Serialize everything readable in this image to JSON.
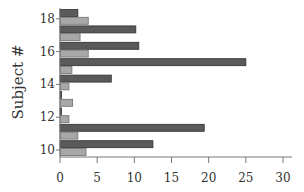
{
  "chart_data": {
    "type": "bar",
    "orientation": "horizontal",
    "title": "",
    "xlabel": "",
    "ylabel": "Subject #",
    "xlim": [
      0,
      30
    ],
    "x_ticks": [
      0,
      5,
      10,
      15,
      20,
      25,
      30
    ],
    "y_tick_labels": [
      "10",
      "12",
      "14",
      "16",
      "18"
    ],
    "categories": [
      "10",
      "11",
      "12",
      "13",
      "14",
      "15",
      "16",
      "17",
      "18"
    ],
    "grid": false,
    "legend": null,
    "series": [
      {
        "name": "dark",
        "color": "#5a5a5a",
        "values": [
          12.5,
          19.4,
          0.2,
          0.2,
          6.9,
          25.0,
          10.6,
          10.2,
          2.4
        ]
      },
      {
        "name": "light",
        "color": "#a8a8a8",
        "values": [
          3.5,
          2.4,
          1.2,
          1.7,
          1.2,
          1.6,
          3.8,
          2.7,
          3.8
        ]
      }
    ]
  }
}
